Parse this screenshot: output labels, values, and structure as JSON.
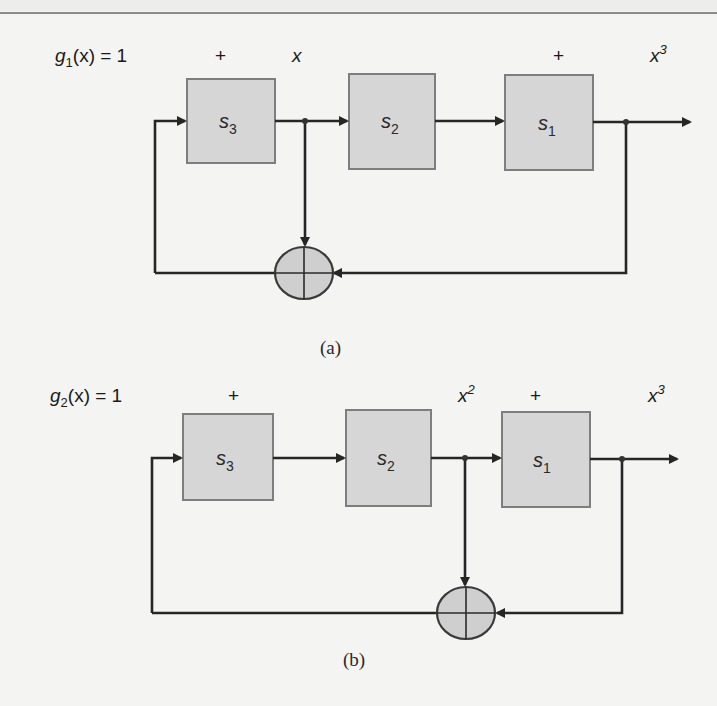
{
  "header": {
    "top_rule": true
  },
  "diagrams": [
    {
      "id": "a",
      "caption": "(a)",
      "polynomial": {
        "g": "g",
        "sub": "1",
        "rest": "(x) = 1",
        "var": "x"
      },
      "labels": {
        "plus_1": "+",
        "term_1": "x",
        "term_1_sup": "",
        "plus_2": "+",
        "term_3": "x",
        "term_3_sup": "3"
      },
      "blocks": [
        {
          "name": "s",
          "sub": "3"
        },
        {
          "name": "s",
          "sub": "2"
        },
        {
          "name": "s",
          "sub": "1"
        }
      ]
    },
    {
      "id": "b",
      "caption": "(b)",
      "polynomial": {
        "g": "g",
        "sub": "2",
        "rest": "(x) = 1",
        "var": "x"
      },
      "labels": {
        "plus_1": "+",
        "term_2": "x",
        "term_2_sup": "2",
        "plus_2": "+",
        "term_3": "x",
        "term_3_sup": "3"
      },
      "blocks": [
        {
          "name": "s",
          "sub": "3"
        },
        {
          "name": "s",
          "sub": "2"
        },
        {
          "name": "s",
          "sub": "1"
        }
      ]
    }
  ],
  "colors": {
    "background": "#f4f4f2",
    "block_fill": "#d6d6d6",
    "block_stroke": "#7e7e7e",
    "wire": "#262626",
    "summing_fill": "#cfcfcf"
  }
}
